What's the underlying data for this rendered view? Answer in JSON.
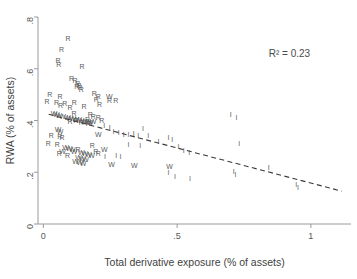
{
  "chart_data": {
    "type": "scatter",
    "title": "",
    "xlabel": "Total derivative exposure (% of assets)",
    "ylabel": "RWA (% of assets)",
    "xlim": [
      -0.02,
      1.15
    ],
    "ylim": [
      0,
      0.8
    ],
    "grid": false,
    "legend_position": "none",
    "xticks": [
      0,
      0.5,
      1
    ],
    "xtick_labels": [
      "0",
      ".5",
      "1"
    ],
    "yticks": [
      0,
      0.2,
      0.4,
      0.6,
      0.8
    ],
    "ytick_labels": [
      "0",
      ".2",
      ".4",
      ".6",
      ".8"
    ],
    "annotations": [
      {
        "text": "R² = 0.23",
        "x": 0.92,
        "y": 0.645
      }
    ],
    "marker_style": "letter-glyph",
    "fit_line": {
      "style": "dashed",
      "x_start": 0.02,
      "y_start": 0.424,
      "x_end": 1.115,
      "y_end": 0.127
    },
    "series": [
      {
        "name": "R",
        "glyph": "R",
        "points": [
          [
            0.092,
            0.716
          ],
          [
            0.068,
            0.673
          ],
          [
            0.055,
            0.628
          ],
          [
            0.058,
            0.612
          ],
          [
            0.145,
            0.608
          ],
          [
            0.105,
            0.56
          ],
          [
            0.118,
            0.553
          ],
          [
            0.128,
            0.54
          ],
          [
            0.133,
            0.534
          ],
          [
            0.125,
            0.527
          ],
          [
            0.137,
            0.524
          ],
          [
            0.142,
            0.519
          ],
          [
            0.024,
            0.497
          ],
          [
            0.062,
            0.492
          ],
          [
            0.19,
            0.5
          ],
          [
            0.205,
            0.491
          ],
          [
            0.014,
            0.47
          ],
          [
            0.049,
            0.468
          ],
          [
            0.08,
            0.463
          ],
          [
            0.116,
            0.468
          ],
          [
            0.198,
            0.478
          ],
          [
            0.247,
            0.476
          ],
          [
            0.271,
            0.475
          ],
          [
            0.21,
            0.46
          ],
          [
            0.064,
            0.455
          ],
          [
            0.1,
            0.449
          ],
          [
            0.152,
            0.452
          ],
          [
            0.115,
            0.424
          ],
          [
            0.175,
            0.42
          ],
          [
            0.187,
            0.414
          ],
          [
            0.205,
            0.41
          ],
          [
            0.165,
            0.402
          ],
          [
            0.122,
            0.396
          ],
          [
            0.218,
            0.398
          ],
          [
            0.1,
            0.392
          ],
          [
            0.142,
            0.39
          ],
          [
            0.168,
            0.385
          ],
          [
            0.03,
            0.34
          ],
          [
            0.061,
            0.337
          ],
          [
            0.07,
            0.332
          ],
          [
            0.018,
            0.307
          ],
          [
            0.052,
            0.305
          ],
          [
            0.183,
            0.3
          ],
          [
            0.13,
            0.287
          ],
          [
            0.196,
            0.276
          ],
          [
            0.205,
            0.27
          ],
          [
            0.06,
            0.268
          ],
          [
            0.09,
            0.262
          ]
        ]
      },
      {
        "name": "W",
        "glyph": "W",
        "points": [
          [
            0.247,
            0.492
          ],
          [
            0.04,
            0.424
          ],
          [
            0.048,
            0.42
          ],
          [
            0.058,
            0.417
          ],
          [
            0.072,
            0.413
          ],
          [
            0.09,
            0.41
          ],
          [
            0.098,
            0.407
          ],
          [
            0.11,
            0.404
          ],
          [
            0.12,
            0.401
          ],
          [
            0.132,
            0.4
          ],
          [
            0.14,
            0.398
          ],
          [
            0.152,
            0.395
          ],
          [
            0.16,
            0.392
          ],
          [
            0.168,
            0.39
          ],
          [
            0.175,
            0.388
          ],
          [
            0.186,
            0.395
          ],
          [
            0.055,
            0.362
          ],
          [
            0.062,
            0.355
          ],
          [
            0.205,
            0.343
          ],
          [
            0.083,
            0.292
          ],
          [
            0.096,
            0.288
          ],
          [
            0.108,
            0.285
          ],
          [
            0.072,
            0.278
          ],
          [
            0.115,
            0.276
          ],
          [
            0.142,
            0.272
          ],
          [
            0.155,
            0.268
          ],
          [
            0.168,
            0.265
          ],
          [
            0.18,
            0.262
          ],
          [
            0.132,
            0.255
          ],
          [
            0.146,
            0.25
          ],
          [
            0.158,
            0.247
          ],
          [
            0.12,
            0.238
          ],
          [
            0.136,
            0.234
          ],
          [
            0.148,
            0.23
          ],
          [
            0.228,
            0.286
          ],
          [
            0.255,
            0.228
          ],
          [
            0.34,
            0.222
          ],
          [
            0.472,
            0.218
          ]
        ]
      },
      {
        "name": "I",
        "glyph": "I",
        "points": [
          [
            0.228,
            0.38
          ],
          [
            0.248,
            0.372
          ],
          [
            0.262,
            0.355
          ],
          [
            0.282,
            0.352
          ],
          [
            0.3,
            0.345
          ],
          [
            0.318,
            0.345
          ],
          [
            0.338,
            0.348
          ],
          [
            0.355,
            0.34
          ],
          [
            0.372,
            0.368
          ],
          [
            0.392,
            0.338
          ],
          [
            0.318,
            0.305
          ],
          [
            0.362,
            0.3
          ],
          [
            0.43,
            0.318
          ],
          [
            0.468,
            0.33
          ],
          [
            0.482,
            0.325
          ],
          [
            0.505,
            0.298
          ],
          [
            0.525,
            0.28
          ],
          [
            0.545,
            0.272
          ],
          [
            0.468,
            0.195
          ],
          [
            0.492,
            0.182
          ],
          [
            0.548,
            0.172
          ],
          [
            0.7,
            0.42
          ],
          [
            0.722,
            0.41
          ],
          [
            0.732,
            0.31
          ],
          [
            0.712,
            0.2
          ],
          [
            0.718,
            0.188
          ],
          [
            0.842,
            0.215
          ],
          [
            0.945,
            0.152
          ],
          [
            0.952,
            0.14
          ],
          [
            0.272,
            0.262
          ],
          [
            0.288,
            0.258
          ],
          [
            0.23,
            0.258
          ]
        ]
      }
    ]
  },
  "figure": {
    "background_color": "#ffffff",
    "axis_color": "#9a9a9a",
    "marker_color": "#5a5a5a",
    "fit_line_color": "#3a3a3a"
  }
}
